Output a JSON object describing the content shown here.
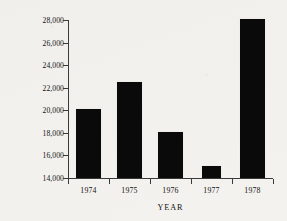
{
  "chart_data": {
    "type": "bar",
    "title": "",
    "xlabel": "YEAR",
    "ylabel": "INCOME, IN DOLLARS",
    "categories": [
      "1974",
      "1975",
      "1976",
      "1977",
      "1978"
    ],
    "values": [
      20100,
      22500,
      18100,
      15100,
      28100
    ],
    "ylim": [
      14000,
      28000
    ],
    "ytick_labels": [
      "14,000",
      "16,000",
      "18,000",
      "20,000",
      "22,000",
      "24,000",
      "26,000",
      "28,000"
    ],
    "ytick_values": [
      14000,
      16000,
      18000,
      20000,
      22000,
      24000,
      26000,
      28000
    ],
    "grid": false,
    "legend": null,
    "bar_color": "#0a0a0a",
    "axis_color": "#3a3a3a",
    "background": "#f4f2ee"
  }
}
